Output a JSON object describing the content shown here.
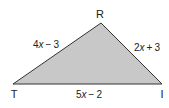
{
  "diagram": {
    "type": "triangle",
    "name": "Triangle TRI",
    "colors": {
      "fill": "#c8c8c8",
      "stroke": "#333333",
      "text": "#222222",
      "background": "#ffffff"
    },
    "vertices": [
      {
        "id": "R",
        "label": "R",
        "x": 101,
        "y": 23,
        "label_x": 100,
        "label_y": 18
      },
      {
        "id": "T",
        "label": "T",
        "x": 13,
        "y": 84,
        "label_x": 14,
        "label_y": 98
      },
      {
        "id": "I",
        "label": "I",
        "x": 162,
        "y": 84,
        "label_x": 162,
        "label_y": 98
      }
    ],
    "sides": [
      {
        "id": "RT",
        "from": "R",
        "to": "T",
        "coefficient": "4",
        "variable": "x",
        "operator": "−",
        "constant": "3",
        "expression": "4x − 3"
      },
      {
        "id": "RI",
        "from": "R",
        "to": "I",
        "coefficient": "2",
        "variable": "x",
        "operator": "+",
        "constant": "3",
        "expression": "2x + 3"
      },
      {
        "id": "TI",
        "from": "T",
        "to": "I",
        "coefficient": "5",
        "variable": "x",
        "operator": "−",
        "constant": "2",
        "expression": "5x − 2"
      }
    ]
  }
}
